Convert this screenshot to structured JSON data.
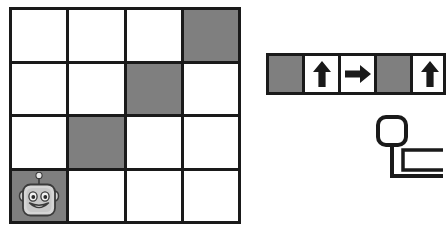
{
  "app": {
    "title": "Robot Grid Programming Puzzle",
    "background_color": "#ffffff",
    "line_color": "#1a1a1a",
    "blocked_color": "#7f7f7f",
    "open_color": "#ffffff"
  },
  "board": {
    "name": "robot-grid",
    "columns": 4,
    "rows": 4,
    "legend": {
      "open_label": "open",
      "blocked_label": "blocked",
      "robot_label": "robot"
    },
    "cells": [
      [
        {
          "state": "open",
          "robot": false
        },
        {
          "state": "open",
          "robot": false
        },
        {
          "state": "open",
          "robot": false
        },
        {
          "state": "blocked",
          "robot": false
        }
      ],
      [
        {
          "state": "open",
          "robot": false
        },
        {
          "state": "open",
          "robot": false
        },
        {
          "state": "blocked",
          "robot": false
        },
        {
          "state": "open",
          "robot": false
        }
      ],
      [
        {
          "state": "open",
          "robot": false
        },
        {
          "state": "blocked",
          "robot": false
        },
        {
          "state": "open",
          "robot": false
        },
        {
          "state": "open",
          "robot": false
        }
      ],
      [
        {
          "state": "blocked",
          "robot": true
        },
        {
          "state": "open",
          "robot": false
        },
        {
          "state": "open",
          "robot": false
        },
        {
          "state": "open",
          "robot": false
        }
      ]
    ],
    "robot": {
      "name": "robot-avatar",
      "row": 3,
      "column": 0,
      "expression": "smiling"
    }
  },
  "sequence": {
    "name": "program-sequence-bar",
    "slot_count": 5,
    "truncated_right": true,
    "slots": [
      {
        "index": 0,
        "icon": "empty-slot",
        "label": ""
      },
      {
        "index": 1,
        "icon": "arrow-up-icon",
        "label": "Up"
      },
      {
        "index": 2,
        "icon": "arrow-right-icon",
        "label": "Right"
      },
      {
        "index": 3,
        "icon": "empty-slot",
        "label": ""
      },
      {
        "index": 4,
        "icon": "arrow-up-icon",
        "label": "Up"
      }
    ]
  },
  "loop_widget": {
    "name": "loop-block",
    "truncated": true,
    "parts": [
      {
        "name": "loop-node-icon",
        "shape": "rounded-square-outline"
      },
      {
        "name": "loop-stem-connector",
        "shape": "vertical-line"
      },
      {
        "name": "loop-body-slot",
        "shape": "rectangle-outline"
      },
      {
        "name": "loop-return-path",
        "shape": "elbow-line"
      }
    ]
  }
}
